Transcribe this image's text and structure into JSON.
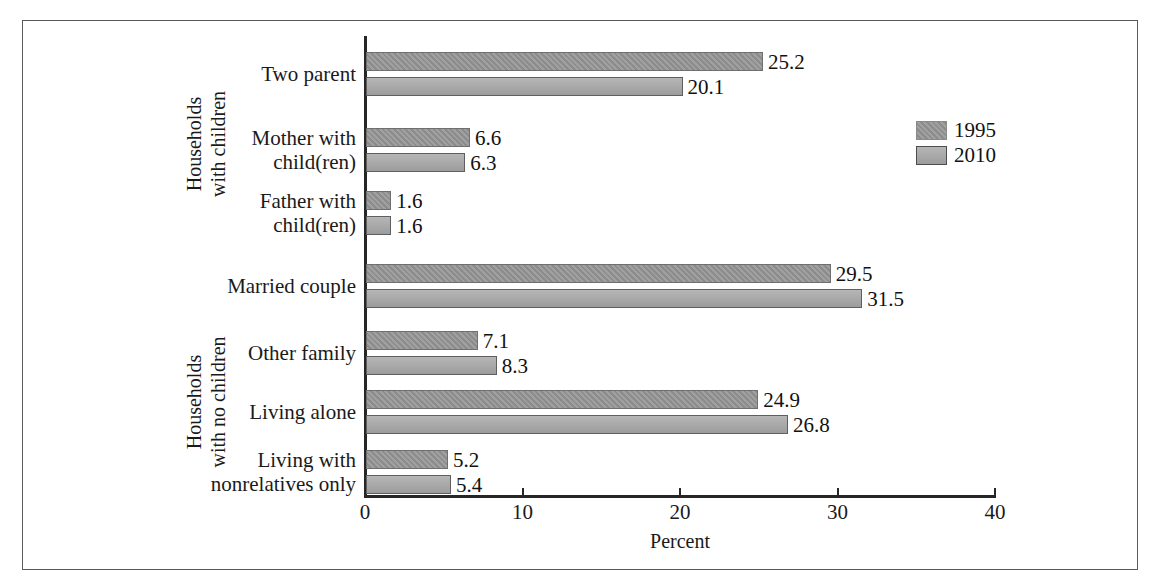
{
  "chart_data": {
    "type": "bar",
    "orientation": "horizontal",
    "title": "",
    "xlabel": "Percent",
    "ylabel": "",
    "xlim": [
      0,
      40
    ],
    "xticks": [
      0,
      10,
      20,
      30,
      40
    ],
    "xtick_labels": [
      "0",
      "10",
      "20",
      "30",
      "40"
    ],
    "grid": false,
    "legend_position": "upper right",
    "categories": [
      "Two parent",
      "Mother with\nchild(ren)",
      "Father with\nchild(ren)",
      "Married couple",
      "Other family",
      "Living alone",
      "Living with\nnonrelatives only"
    ],
    "series": [
      {
        "name": "1995",
        "color": "#939393",
        "values": [
          25.2,
          6.6,
          1.6,
          29.5,
          7.1,
          24.9,
          5.2
        ]
      },
      {
        "name": "2010",
        "color": "#a6a6a6",
        "values": [
          20.1,
          6.3,
          1.6,
          31.5,
          8.3,
          26.8,
          5.4
        ]
      }
    ],
    "value_labels": {
      "1995": [
        "25.2",
        "6.6",
        "1.6",
        "29.5",
        "7.1",
        "24.9",
        "5.2"
      ],
      "2010": [
        "20.1",
        "6.3",
        "1.6",
        "31.5",
        "8.3",
        "26.8",
        "5.4"
      ]
    },
    "groups": [
      {
        "label": "Households\nwith children",
        "categories": [
          "Two parent",
          "Mother with\nchild(ren)",
          "Father with\nchild(ren)"
        ]
      },
      {
        "label": "Households\nwith no children",
        "categories": [
          "Married couple",
          "Other family",
          "Living alone",
          "Living with\nnonrelatives only"
        ]
      }
    ]
  },
  "axis": {
    "x_title": "Percent",
    "ticks": [
      "0",
      "10",
      "20",
      "30",
      "40"
    ]
  },
  "legend": {
    "entries": [
      {
        "label": "1995"
      },
      {
        "label": "2010"
      }
    ]
  },
  "groups": {
    "upper": "Households\nwith children",
    "lower": "Households\nwith no children"
  },
  "categories": [
    {
      "label": "Two parent"
    },
    {
      "label": "Mother with\nchild(ren)"
    },
    {
      "label": "Father with\nchild(ren)"
    },
    {
      "label": "Married couple"
    },
    {
      "label": "Other family"
    },
    {
      "label": "Living alone"
    },
    {
      "label": "Living with\nnonrelatives only"
    }
  ],
  "bars": [
    {
      "cat": "Two parent",
      "series": "1995",
      "value": 25.2,
      "label": "25.2"
    },
    {
      "cat": "Two parent",
      "series": "2010",
      "value": 20.1,
      "label": "20.1"
    },
    {
      "cat": "Mother with child(ren)",
      "series": "1995",
      "value": 6.6,
      "label": "6.6"
    },
    {
      "cat": "Mother with child(ren)",
      "series": "2010",
      "value": 6.3,
      "label": "6.3"
    },
    {
      "cat": "Father with child(ren)",
      "series": "1995",
      "value": 1.6,
      "label": "1.6"
    },
    {
      "cat": "Father with child(ren)",
      "series": "2010",
      "value": 1.6,
      "label": "1.6"
    },
    {
      "cat": "Married couple",
      "series": "1995",
      "value": 29.5,
      "label": "29.5"
    },
    {
      "cat": "Married couple",
      "series": "2010",
      "value": 31.5,
      "label": "31.5"
    },
    {
      "cat": "Other family",
      "series": "1995",
      "value": 7.1,
      "label": "7.1"
    },
    {
      "cat": "Other family",
      "series": "2010",
      "value": 8.3,
      "label": "8.3"
    },
    {
      "cat": "Living alone",
      "series": "1995",
      "value": 24.9,
      "label": "24.9"
    },
    {
      "cat": "Living alone",
      "series": "2010",
      "value": 26.8,
      "label": "26.8"
    },
    {
      "cat": "Living with nonrelatives only",
      "series": "1995",
      "value": 5.2,
      "label": "5.2"
    },
    {
      "cat": "Living with nonrelatives only",
      "series": "2010",
      "value": 5.4,
      "label": "5.4"
    }
  ]
}
